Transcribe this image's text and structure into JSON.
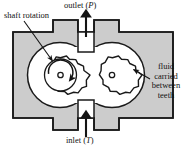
{
  "figure": {
    "kind": "external-gear-pump-cross-section",
    "colors": {
      "housing_fill": "#cccccc",
      "outline": "#1a1a1a",
      "gear_fill": "#ffffff",
      "background": "#ffffff",
      "text": "#111111"
    }
  },
  "labels": {
    "shaft_rotation": "shaft rotation",
    "outlet": {
      "word": "outlet",
      "symbol": "P",
      "full": "outlet (P)"
    },
    "inlet": {
      "word": "inlet",
      "symbol": "T",
      "full": "inlet (T)"
    },
    "fluid_carried": {
      "line1": "fluid",
      "line2": "carried",
      "line3": "between",
      "line4": "teeth",
      "full": "fluid carried between teeth"
    }
  },
  "annotations": {
    "shaft_rotation_arrow": "leader-arrow-to-left-gear",
    "fluid_arrow": "leader-arrow-to-right-gear-teeth",
    "outlet_flow_arrow": "arrow-up",
    "inlet_flow_arrow": "arrow-up",
    "gear_rotation_arrow": "curved-arrow-clockwise"
  },
  "geometry": {
    "left_gear": {
      "cx": 60,
      "cy": 75,
      "teeth": 15,
      "outer_r": 30,
      "hub_r": 16,
      "bore_r": 2.6
    },
    "right_gear": {
      "cx": 112,
      "cy": 75,
      "teeth": 15,
      "outer_r": 30,
      "hub_r": 0,
      "bore_r": 2.6
    },
    "outlet_port_x": 86,
    "inlet_port_x": 86
  }
}
